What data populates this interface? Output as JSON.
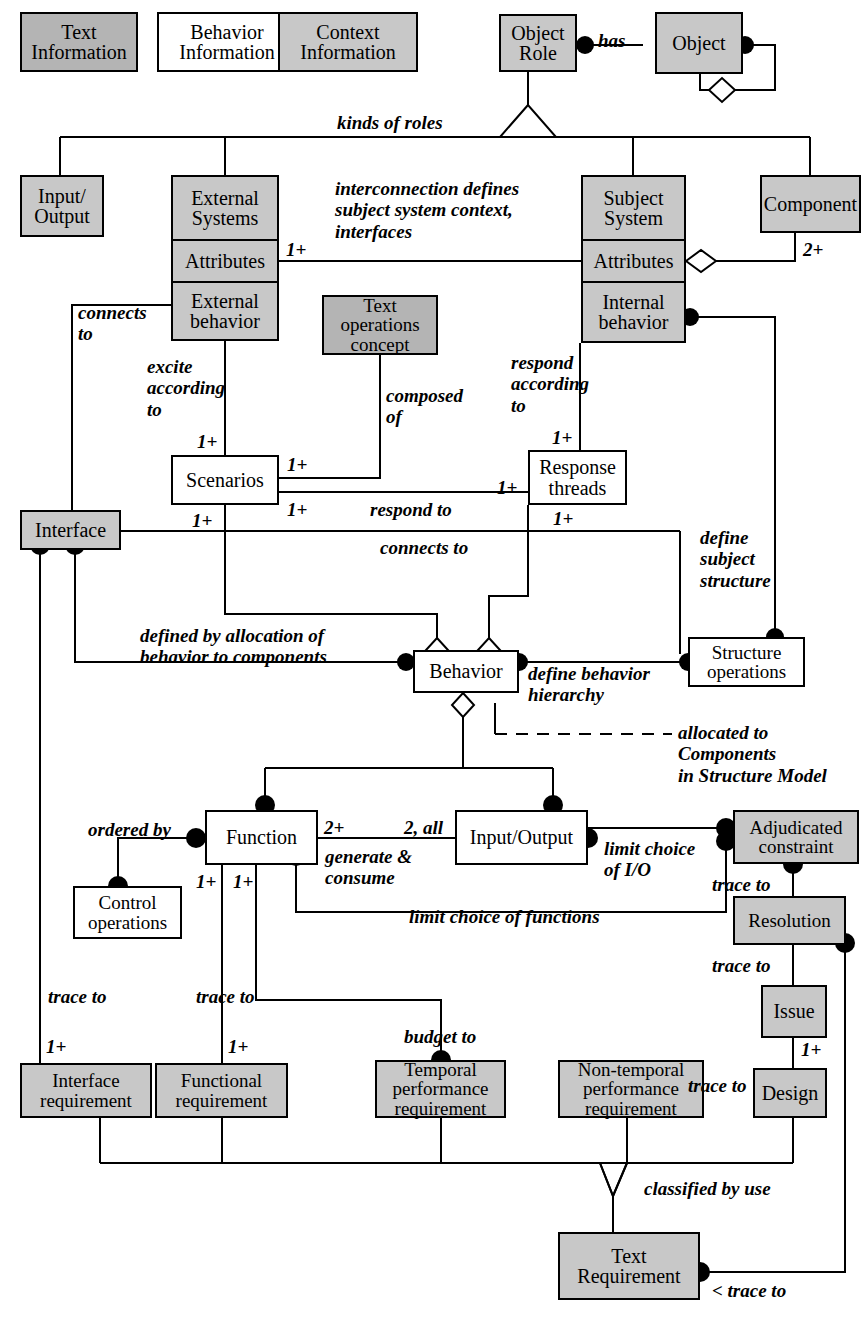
{
  "diagram": {
    "style": {
      "fill_gray": "#c8c8c8",
      "fill_dark": "#b4b4b4",
      "fill_white": "#ffffff",
      "stroke": "#000000",
      "background": "#ffffff"
    }
  },
  "legend": {
    "items": [
      {
        "label": "Text\nInformation",
        "fill": "dark"
      },
      {
        "label": "Behavior\nInformation",
        "fill": "white"
      },
      {
        "label": "Context\nInformation",
        "fill": "gray"
      }
    ]
  },
  "nodes": {
    "text_information": "Text\nInformation",
    "behavior_information": "Behavior\nInformation",
    "context_information": "Context\nInformation",
    "object_role": "Object\nRole",
    "object": "Object",
    "input_output_top": "Input/\nOutput",
    "external_systems": "External\nSystems",
    "external_attributes": "Attributes",
    "external_behavior": "External\nbehavior",
    "subject_system": "Subject\nSystem",
    "subject_attributes": "Attributes",
    "internal_behavior": "Internal\nbehavior",
    "component": "Component",
    "text_operations_concept": "Text\noperations\nconcept",
    "scenarios": "Scenarios",
    "response_threads": "Response\nthreads",
    "interface": "Interface",
    "structure_operations": "Structure\noperations",
    "behavior": "Behavior",
    "function": "Function",
    "input_output_mid": "Input/Output",
    "adjudicated_constraint": "Adjudicated\nconstraint",
    "control_operations": "Control\noperations",
    "resolution": "Resolution",
    "issue": "Issue",
    "design": "Design",
    "interface_requirement": "Interface\nrequirement",
    "functional_requirement": "Functional\nrequirement",
    "temporal_performance_requirement": "Temporal\nperformance\nrequirement",
    "non_temporal_performance_requirement": "Non-temporal\nperformance\nrequirement",
    "text_requirement": "Text\nRequirement"
  },
  "edge_labels": {
    "has": "has",
    "kinds_of_roles": "kinds of roles",
    "interconnection": "interconnection defines\nsubject system context,\ninterfaces",
    "connects_to_left": "connects\nto",
    "excite_according_to": "excite\naccording\nto",
    "composed_of": "composed\nof",
    "respond_according_to": "respond\naccording\nto",
    "respond_to": "respond to",
    "connects_to_mid": "connects to",
    "define_subject_structure": "define\nsubject\nstructure",
    "defined_by_allocation": "defined by allocation of\nbehavior to components",
    "define_behavior_hierarchy": "define behavior\nhierarchy",
    "allocated_to_components": "allocated to Components\nin Structure Model",
    "ordered_by": "ordered by",
    "generate_consume": "generate &\nconsume",
    "limit_choice_of_io": "limit choice\nof I/O",
    "limit_choice_of_functions": "limit choice of functions",
    "trace_to_adjudicated": "trace to",
    "trace_to_resolution": "trace to",
    "trace_to_issue": "trace to",
    "trace_to_interface": "trace to",
    "trace_to_functional": "trace to",
    "budget_to": "budget to",
    "classified_by_use": "classified by use",
    "trace_to_text_req": "< trace to"
  },
  "multiplicities": {
    "ext_attributes": "1+",
    "component": "2+",
    "scenarios_top": "1+",
    "scenarios_right_top": "1+",
    "scenarios_bottom": "1+",
    "scenarios_respond": "1+",
    "response_threads_top": "1+",
    "response_threads_left": "1+",
    "response_threads_bottom": "1+",
    "function_right": "2+",
    "io_left": "2, all",
    "function_bottom_left": "1+",
    "function_bottom_right": "1+",
    "interface_req": "1+",
    "functional_req": "1+",
    "issue_design": "1+"
  }
}
